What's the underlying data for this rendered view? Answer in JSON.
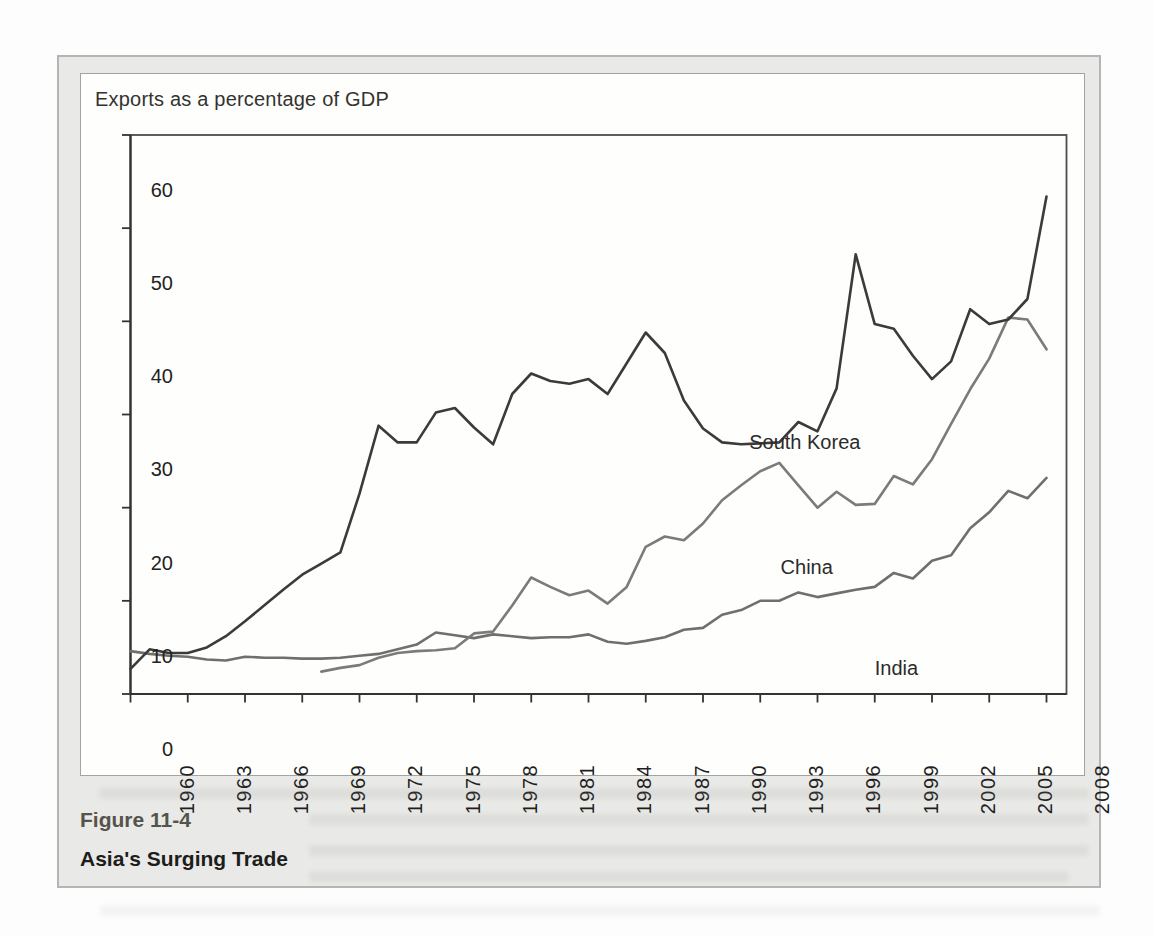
{
  "figure": {
    "chart_title": "Exports as a percentage of GDP",
    "label": "Figure 11-4",
    "caption": "Asia's Surging Trade"
  },
  "chart_data": {
    "type": "line",
    "title": "Exports as a percentage of GDP",
    "x_start": 1960,
    "x_end": 2008,
    "x_tick_years": [
      1960,
      1963,
      1966,
      1969,
      1972,
      1975,
      1978,
      1981,
      1984,
      1987,
      1990,
      1993,
      1996,
      1999,
      2002,
      2005,
      2008
    ],
    "y_ticks": [
      0,
      10,
      20,
      30,
      40,
      50,
      60
    ],
    "ylim": [
      0,
      60
    ],
    "grid": false,
    "legend": "inline-labels",
    "series": [
      {
        "name": "India",
        "color": "#6f6f6f",
        "values": [
          4.6,
          4.3,
          4.1,
          4.0,
          3.7,
          3.6,
          4.0,
          3.9,
          3.9,
          3.8,
          3.8,
          3.9,
          4.1,
          4.3,
          4.8,
          5.3,
          6.6,
          6.3,
          6.0,
          6.4,
          6.2,
          6.0,
          6.1,
          6.1,
          6.4,
          5.6,
          5.4,
          5.7,
          6.1,
          6.9,
          7.1,
          8.5,
          9.0,
          10.0,
          10.0,
          10.9,
          10.4,
          10.8,
          11.2,
          11.5,
          13.0,
          12.4,
          14.3,
          14.9,
          17.8,
          19.5,
          21.8,
          21.0,
          23.2
        ]
      },
      {
        "name": "China",
        "color": "#7b7b7b",
        "values": [
          null,
          null,
          null,
          null,
          null,
          null,
          null,
          null,
          null,
          null,
          2.4,
          2.8,
          3.1,
          3.9,
          4.4,
          4.6,
          4.7,
          4.9,
          6.5,
          6.7,
          9.5,
          12.5,
          11.5,
          10.6,
          11.1,
          9.7,
          11.5,
          15.8,
          16.9,
          16.5,
          18.3,
          20.8,
          22.4,
          23.9,
          24.8,
          22.4,
          20.0,
          21.7,
          20.3,
          20.4,
          23.4,
          22.5,
          25.2,
          29.0,
          32.7,
          36.0,
          40.4,
          40.2,
          37.0
        ]
      },
      {
        "name": "South Korea",
        "color": "#3b3b3b",
        "values": [
          2.7,
          4.8,
          4.4,
          4.4,
          5.0,
          6.2,
          7.8,
          9.5,
          11.2,
          12.8,
          14.0,
          15.2,
          21.5,
          28.8,
          27.0,
          27.0,
          30.2,
          30.7,
          28.6,
          26.8,
          32.2,
          34.4,
          33.6,
          33.3,
          33.8,
          32.2,
          35.5,
          38.8,
          36.6,
          31.5,
          28.5,
          27.0,
          26.8,
          26.9,
          27.0,
          29.2,
          28.2,
          32.8,
          47.2,
          39.7,
          39.2,
          36.3,
          33.8,
          35.7,
          41.3,
          39.7,
          40.2,
          42.4,
          53.4
        ]
      }
    ],
    "annotations": [
      {
        "text": "South Korea",
        "x_year": 1992.4,
        "y_value": 33.0
      },
      {
        "text": "China",
        "x_year": 1992.5,
        "y_value": 19.5
      },
      {
        "text": "India",
        "x_year": 1997.2,
        "y_value": 8.7
      }
    ]
  }
}
